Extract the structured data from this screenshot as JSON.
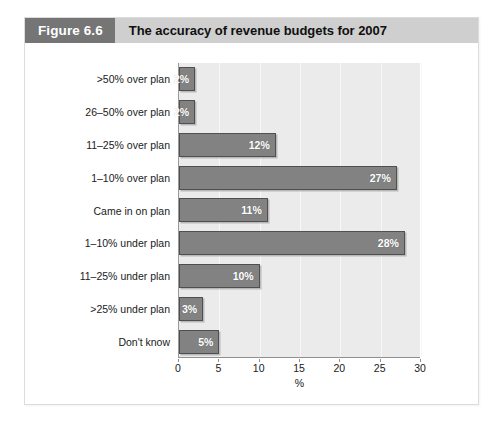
{
  "figure": {
    "number_label": "Figure 6.6",
    "title": "The accuracy of revenue budgets for 2007"
  },
  "colors": {
    "header_band": "#cfcfcf",
    "figure_number_band": "#757575",
    "bar_fill": "#828282",
    "bar_border": "#4f4f4f",
    "plot_background": "#ebebeb",
    "bar_label_text": "#ffffff"
  },
  "chart_data": {
    "type": "bar",
    "orientation": "horizontal",
    "title": "The accuracy of revenue budgets for 2007",
    "xlabel": "%",
    "ylabel": "",
    "xlim": [
      0,
      30
    ],
    "xticks": [
      0,
      5,
      10,
      15,
      20,
      25,
      30
    ],
    "xtick_labels": [
      "0",
      "5",
      "10",
      "15",
      "20",
      "25",
      "30"
    ],
    "grid": true,
    "legend": false,
    "categories": [
      ">50% over plan",
      "26–50% over plan",
      "11–25% over plan",
      "1–10% over plan",
      "Came in on plan",
      "1–10% under plan",
      "11–25% under plan",
      ">25% under plan",
      "Don't know"
    ],
    "values": [
      2,
      2,
      12,
      27,
      11,
      28,
      10,
      3,
      5
    ],
    "data_labels": [
      "2%",
      "2%",
      "12%",
      "27%",
      "11%",
      "28%",
      "10%",
      "3%",
      "5%"
    ]
  }
}
